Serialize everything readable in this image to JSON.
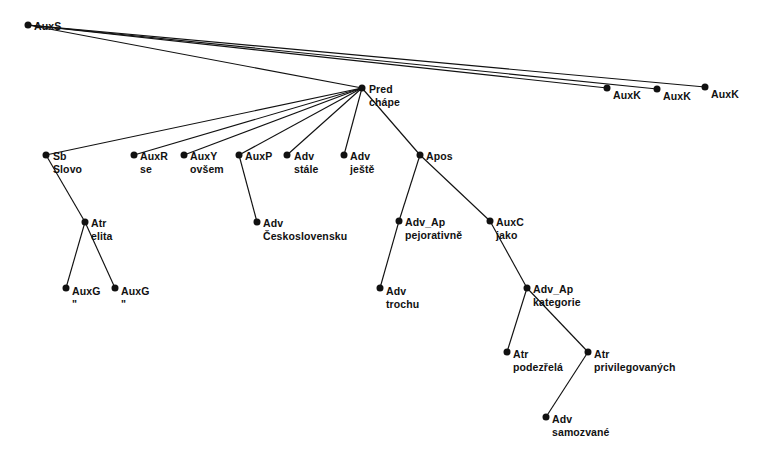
{
  "diagram": {
    "type": "dependency-tree",
    "background_color": "#ffffff",
    "node_color": "#111111",
    "edge_color": "#111111",
    "width": 770,
    "height": 465,
    "nodes": [
      {
        "id": "n0",
        "afun": "AuxS",
        "word": "",
        "x": 28,
        "y": 25,
        "lx": 34,
        "ly": 20
      },
      {
        "id": "n1",
        "afun": "Pred",
        "word": "chápe",
        "x": 362,
        "y": 88,
        "lx": 369,
        "ly": 83
      },
      {
        "id": "n2",
        "afun": "AuxK",
        "word": "",
        "x": 607,
        "y": 88,
        "lx": 613,
        "ly": 89
      },
      {
        "id": "n3",
        "afun": "AuxK",
        "word": "",
        "x": 657,
        "y": 89,
        "lx": 663,
        "ly": 90
      },
      {
        "id": "n4",
        "afun": "AuxK",
        "word": "",
        "x": 705,
        "y": 87,
        "lx": 711,
        "ly": 88
      },
      {
        "id": "n5",
        "afun": "Sb",
        "word": "Slovo",
        "x": 46,
        "y": 155,
        "lx": 53,
        "ly": 150
      },
      {
        "id": "n6",
        "afun": "AuxR",
        "word": "se",
        "x": 134,
        "y": 155,
        "lx": 140,
        "ly": 150
      },
      {
        "id": "n7",
        "afun": "AuxY",
        "word": "ovšem",
        "x": 184,
        "y": 155,
        "lx": 190,
        "ly": 150
      },
      {
        "id": "n8",
        "afun": "AuxP",
        "word": "",
        "x": 239,
        "y": 155,
        "lx": 245,
        "ly": 150
      },
      {
        "id": "n9",
        "afun": "Adv",
        "word": "stále",
        "x": 287,
        "y": 155,
        "lx": 294,
        "ly": 150
      },
      {
        "id": "n10",
        "afun": "Adv",
        "word": "ještě",
        "x": 344,
        "y": 155,
        "lx": 350,
        "ly": 150
      },
      {
        "id": "n11",
        "afun": "Apos",
        "word": "",
        "x": 420,
        "y": 155,
        "lx": 426,
        "ly": 150
      },
      {
        "id": "n12",
        "afun": "Atr",
        "word": "elita",
        "x": 85,
        "y": 222,
        "lx": 91,
        "ly": 217
      },
      {
        "id": "n13",
        "afun": "Adv",
        "word": "Československu",
        "x": 257,
        "y": 222,
        "lx": 263,
        "ly": 217
      },
      {
        "id": "n14",
        "afun": "Adv_Ap",
        "word": "pejorativně",
        "x": 399,
        "y": 221,
        "lx": 405,
        "ly": 216
      },
      {
        "id": "n15",
        "afun": "AuxC",
        "word": "jako",
        "x": 490,
        "y": 221,
        "lx": 496,
        "ly": 216
      },
      {
        "id": "n16",
        "afun": "AuxG",
        "word": "\"",
        "x": 66,
        "y": 288,
        "lx": 72,
        "ly": 285
      },
      {
        "id": "n17",
        "afun": "AuxG",
        "word": "\"",
        "x": 115,
        "y": 288,
        "lx": 121,
        "ly": 285
      },
      {
        "id": "n18",
        "afun": "Adv",
        "word": "trochu",
        "x": 380,
        "y": 288,
        "lx": 386,
        "ly": 285
      },
      {
        "id": "n19",
        "afun": "Adv_Ap",
        "word": "kategorie",
        "x": 527,
        "y": 288,
        "lx": 533,
        "ly": 283
      },
      {
        "id": "n20",
        "afun": "Atr",
        "word": "podezřelá",
        "x": 507,
        "y": 352,
        "lx": 513,
        "ly": 348
      },
      {
        "id": "n21",
        "afun": "Atr",
        "word": "privilegovaných",
        "x": 588,
        "y": 352,
        "lx": 594,
        "ly": 348
      },
      {
        "id": "n22",
        "afun": "Adv",
        "word": "samozvané",
        "x": 546,
        "y": 417,
        "lx": 552,
        "ly": 413
      }
    ],
    "edges": [
      {
        "from": "n0",
        "to": "n1"
      },
      {
        "from": "n0",
        "to": "n2"
      },
      {
        "from": "n0",
        "to": "n3"
      },
      {
        "from": "n0",
        "to": "n4"
      },
      {
        "from": "n1",
        "to": "n5"
      },
      {
        "from": "n1",
        "to": "n6"
      },
      {
        "from": "n1",
        "to": "n7"
      },
      {
        "from": "n1",
        "to": "n8"
      },
      {
        "from": "n1",
        "to": "n9"
      },
      {
        "from": "n1",
        "to": "n10"
      },
      {
        "from": "n1",
        "to": "n11"
      },
      {
        "from": "n5",
        "to": "n12"
      },
      {
        "from": "n8",
        "to": "n13"
      },
      {
        "from": "n11",
        "to": "n14"
      },
      {
        "from": "n11",
        "to": "n15"
      },
      {
        "from": "n12",
        "to": "n16"
      },
      {
        "from": "n12",
        "to": "n17"
      },
      {
        "from": "n14",
        "to": "n18"
      },
      {
        "from": "n15",
        "to": "n19"
      },
      {
        "from": "n19",
        "to": "n20"
      },
      {
        "from": "n19",
        "to": "n21"
      },
      {
        "from": "n21",
        "to": "n22"
      }
    ]
  }
}
